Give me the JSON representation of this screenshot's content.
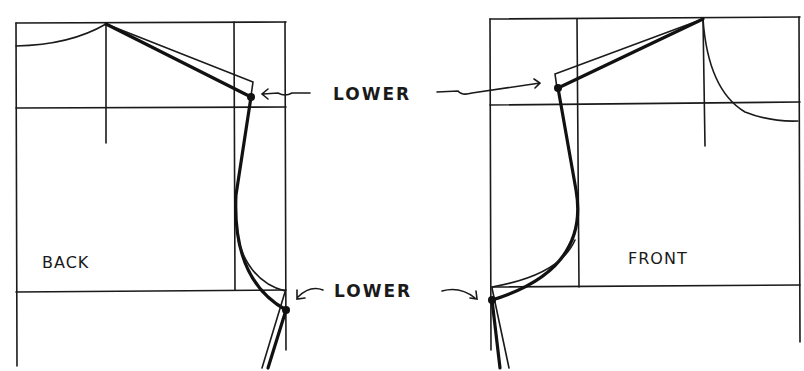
{
  "diagram": {
    "panels": {
      "back": {
        "label": "BACK"
      },
      "front": {
        "label": "FRONT"
      }
    },
    "annotations": {
      "shoulder": {
        "text": "LOWER"
      },
      "underarm": {
        "text": "LOWER"
      }
    },
    "colors": {
      "ink": "#111111",
      "background": "#ffffff"
    }
  }
}
